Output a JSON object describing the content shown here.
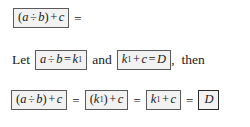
{
  "document": {
    "type": "math-derivation",
    "background_color": "#ffffff",
    "text_color": "#1a1a1a",
    "box_border_color": "#5a5a5a",
    "box_fill_color": "#f2f2f2",
    "emphasis_box_border_color": "#2b2b2b"
  },
  "line1": {
    "expr_box": {
      "open_paren": "(",
      "a": "a",
      "op1": "÷",
      "b": "b",
      "close_paren": ")",
      "op2": "+",
      "c": "c",
      "plain": "(a ÷ b) + c"
    },
    "equals": "="
  },
  "line2": {
    "let_word": "Let",
    "box1": {
      "a": "a",
      "op": "÷",
      "b": "b",
      "equals": "=",
      "k": "k",
      "k_sub": "1",
      "plain": "a ÷ b = k₁"
    },
    "and_word": "and",
    "box2": {
      "k": "k",
      "k_sub": "1",
      "op": "+",
      "c": "c",
      "equals": "=",
      "D": "D",
      "plain": "k₁ + c = D"
    },
    "comma": ",",
    "then_word": "then"
  },
  "line3": {
    "box1": {
      "open_paren": "(",
      "a": "a",
      "op1": "÷",
      "b": "b",
      "close_paren": ")",
      "op2": "+",
      "c": "c",
      "plain": "(a ÷ b) + c"
    },
    "eq1": "=",
    "box2": {
      "open_paren": "(",
      "k": "k",
      "k_sub": "1",
      "close_paren": ")",
      "op": "+",
      "c": "c",
      "plain": "(k₁) + c"
    },
    "eq2": "=",
    "box3": {
      "k": "k",
      "k_sub": "1",
      "op": "+",
      "c": "c",
      "plain": "k₁ + c"
    },
    "eq3": "=",
    "box4": {
      "D": "D",
      "plain": "D"
    }
  }
}
